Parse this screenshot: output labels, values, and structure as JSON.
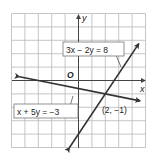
{
  "chart_data": {
    "type": "line",
    "title": "",
    "xlabel": "x",
    "ylabel": "y",
    "origin_label": "O",
    "xlim": [
      -5,
      5
    ],
    "ylim": [
      -5,
      5
    ],
    "grid": true,
    "series": [
      {
        "name": "3x − 2y = 8",
        "equation": "y = 1.5x - 4",
        "slope": 1.5,
        "intercept": -4,
        "x": [
          -0.67,
          4.5
        ],
        "y": [
          -5,
          2.75
        ]
      },
      {
        "name": "x + 5y = −3",
        "equation": "y = -0.2x - 0.6",
        "slope": -0.2,
        "intercept": -0.6,
        "x": [
          -4.4,
          4.6
        ],
        "y": [
          0.28,
          -1.52
        ]
      }
    ],
    "annotations": [
      {
        "text": "(2, −1)",
        "x": 2,
        "y": -1,
        "type": "intersection"
      }
    ]
  },
  "labels": {
    "axis_x": "x",
    "axis_y": "y",
    "origin": "O",
    "eq1": "3x − 2y = 8",
    "eq2": "x + 5y = −3",
    "intersection": "(2, −1)"
  }
}
